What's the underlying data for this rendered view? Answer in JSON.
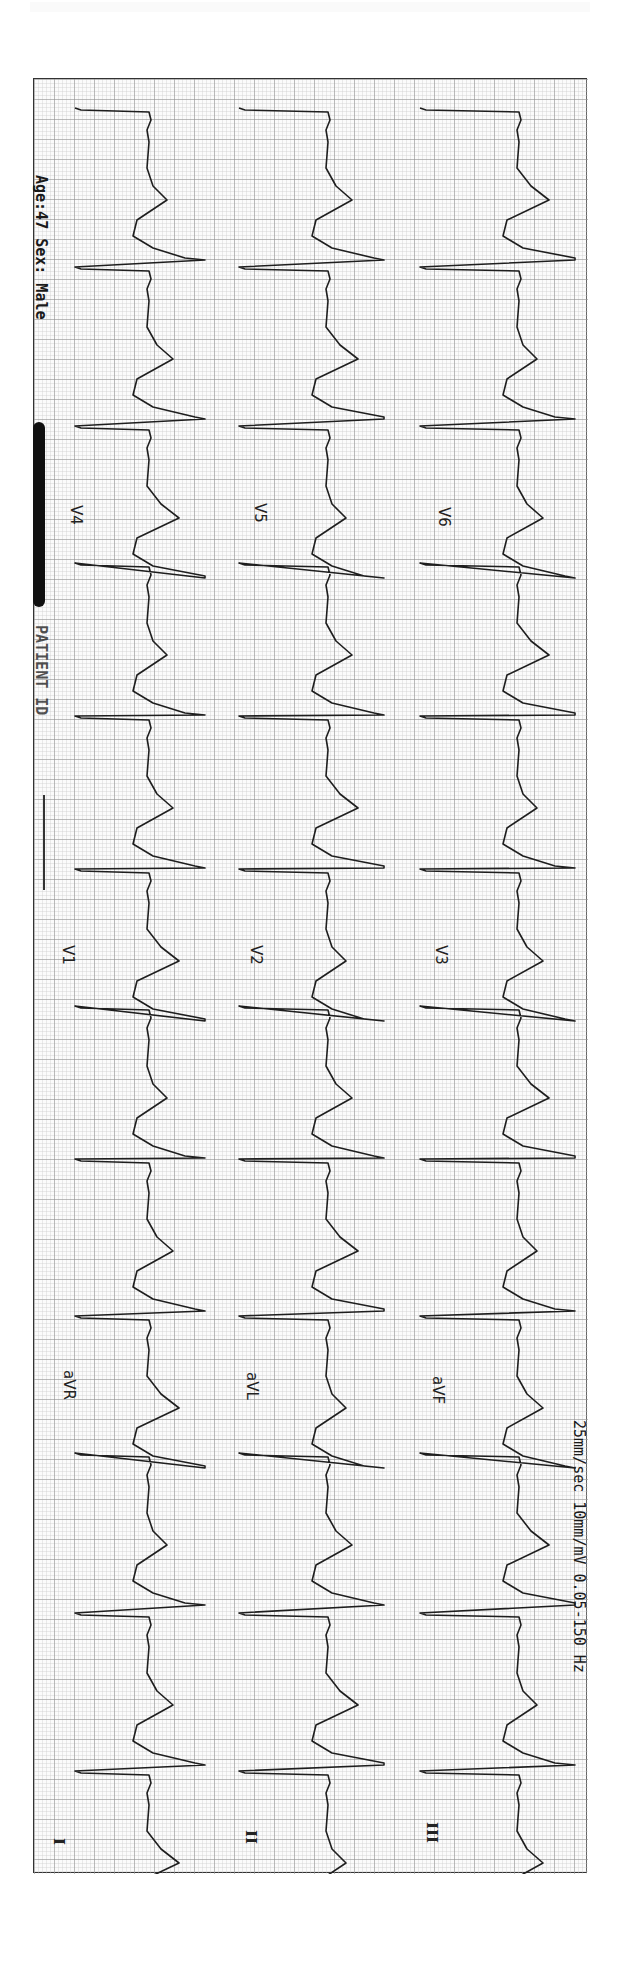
{
  "header": {
    "age_sex": "Age:47  Sex: Male",
    "patient_id_partial": "PATIENT ID",
    "redacted": true
  },
  "footer": {
    "settings": "25mm/sec 10mm/mV 0.05-150 Hz"
  },
  "orientation": "rotated 90° clockwise (time runs top to bottom)",
  "colors": {
    "paper": "#fbfbfb",
    "grid_minor": "#c8c8c8",
    "grid_major": "#8a8a8a",
    "trace": "#1e1e1e",
    "border": "#333333"
  },
  "leads": {
    "col1": [
      "I",
      "aVR",
      "V1",
      "V4"
    ],
    "col2": [
      "II",
      "aVL",
      "V2",
      "V5"
    ],
    "col3": [
      "III",
      "aVF",
      "V3",
      "V6"
    ]
  },
  "chart_data": {
    "type": "line",
    "xlabel": "Time",
    "ylabel": "Voltage (mV)",
    "paper_speed": "25mm/sec",
    "gain": "10mm/mV",
    "filter": "0.05-150 Hz",
    "grid": true,
    "layout": "3 rows x 4 columns",
    "rows": [
      {
        "row": 1,
        "leads": [
          "I",
          "aVR",
          "V1",
          "V4"
        ]
      },
      {
        "row": 2,
        "leads": [
          "II",
          "aVL",
          "V2",
          "V5"
        ]
      },
      {
        "row": 3,
        "leads": [
          "III",
          "aVF",
          "V3",
          "V6"
        ]
      }
    ],
    "beat_positions_px": [
      107,
      266,
      425,
      562,
      715,
      868,
      1005,
      1158,
      1315,
      1452,
      1612,
      1770
    ],
    "approx_rr_ms": 630,
    "approx_heart_rate_bpm": 95,
    "morphology": "wide QRS complexes with prominent ST/T changes"
  }
}
